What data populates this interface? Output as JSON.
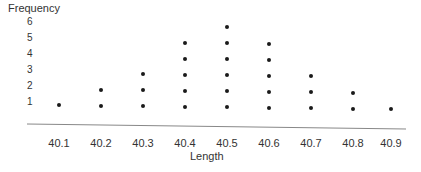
{
  "chart_data": {
    "type": "scatter",
    "subtype": "dot_plot",
    "title": "",
    "xlabel": "Length",
    "ylabel": "Frequency",
    "categories": [
      "40.1",
      "40.2",
      "40.3",
      "40.4",
      "40.5",
      "40.6",
      "40.7",
      "40.8",
      "40.9"
    ],
    "values": [
      1,
      2,
      3,
      5,
      6,
      5,
      3,
      2,
      1
    ],
    "y_ticks": [
      "1",
      "2",
      "3",
      "4",
      "5",
      "6"
    ],
    "ylim": [
      0,
      6
    ],
    "grid": false,
    "legend": null
  },
  "labels": {
    "ylabel": "Frequency",
    "xlabel": "Length",
    "yticks": [
      "1",
      "2",
      "3",
      "4",
      "5",
      "6"
    ],
    "xticks": [
      "40.1",
      "40.2",
      "40.3",
      "40.4",
      "40.5",
      "40.6",
      "40.7",
      "40.8",
      "40.9"
    ]
  }
}
